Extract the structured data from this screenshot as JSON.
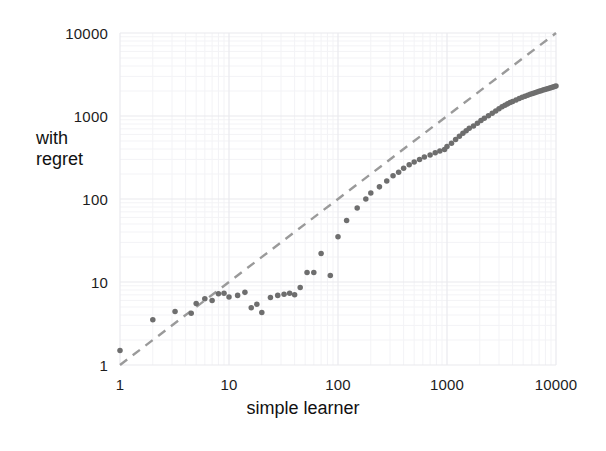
{
  "chart_data": {
    "type": "scatter",
    "title": "",
    "subtitle": "",
    "xlabel": "simple learner",
    "ylabel": "with regret",
    "xscale": "log",
    "yscale": "log",
    "xlim": [
      1,
      10000
    ],
    "ylim": [
      1,
      10000
    ],
    "xticks": [
      1,
      10,
      100,
      1000,
      10000
    ],
    "yticks": [
      1,
      10,
      100,
      1000,
      10000
    ],
    "xtick_labels": [
      "1",
      "10",
      "100",
      "1000",
      "10000"
    ],
    "ytick_labels": [
      "1",
      "10",
      "100",
      "1000",
      "10000"
    ],
    "grid": true,
    "minor_grid": true,
    "legend": "none",
    "annotations": [],
    "series": [
      {
        "name": "data",
        "type": "scatter",
        "marker": "circle",
        "marker_size": 4,
        "color": "#6e6e6e",
        "points": [
          [
            1,
            1.5
          ],
          [
            2,
            3.5
          ],
          [
            3.2,
            4.4
          ],
          [
            4.5,
            4.2
          ],
          [
            5,
            5.5
          ],
          [
            6,
            6.3
          ],
          [
            7,
            6.0
          ],
          [
            8,
            7.2
          ],
          [
            9,
            7.3
          ],
          [
            10,
            6.6
          ],
          [
            12,
            6.9
          ],
          [
            14,
            7.5
          ],
          [
            16,
            4.9
          ],
          [
            18,
            5.4
          ],
          [
            20,
            4.3
          ],
          [
            24,
            6.5
          ],
          [
            28,
            6.9
          ],
          [
            32,
            7.1
          ],
          [
            36,
            7.3
          ],
          [
            40,
            7.0
          ],
          [
            45,
            8.6
          ],
          [
            52,
            13
          ],
          [
            60,
            13
          ],
          [
            70,
            22
          ],
          [
            85,
            12
          ],
          [
            100,
            35
          ],
          [
            120,
            55
          ],
          [
            150,
            78
          ],
          [
            180,
            100
          ],
          [
            200,
            118
          ],
          [
            240,
            140
          ],
          [
            280,
            165
          ],
          [
            320,
            190
          ],
          [
            360,
            210
          ],
          [
            400,
            235
          ],
          [
            450,
            258
          ],
          [
            500,
            280
          ],
          [
            560,
            300
          ],
          [
            620,
            320
          ],
          [
            700,
            340
          ],
          [
            780,
            360
          ],
          [
            860,
            378
          ],
          [
            950,
            395
          ],
          [
            1000,
            430
          ],
          [
            1100,
            470
          ],
          [
            1200,
            520
          ],
          [
            1300,
            570
          ],
          [
            1400,
            620
          ],
          [
            1500,
            665
          ],
          [
            1600,
            710
          ],
          [
            1750,
            760
          ],
          [
            1900,
            820
          ],
          [
            2050,
            880
          ],
          [
            2200,
            940
          ],
          [
            2400,
            1010
          ],
          [
            2600,
            1080
          ],
          [
            2800,
            1150
          ],
          [
            3000,
            1220
          ],
          [
            3200,
            1290
          ],
          [
            3400,
            1350
          ],
          [
            3600,
            1400
          ],
          [
            3800,
            1450
          ],
          [
            4000,
            1500
          ],
          [
            4300,
            1560
          ],
          [
            4600,
            1620
          ],
          [
            4900,
            1680
          ],
          [
            5200,
            1730
          ],
          [
            5500,
            1780
          ],
          [
            5800,
            1830
          ],
          [
            6100,
            1870
          ],
          [
            6400,
            1910
          ],
          [
            6700,
            1950
          ],
          [
            7000,
            1985
          ],
          [
            7300,
            2020
          ],
          [
            7600,
            2055
          ],
          [
            7900,
            2090
          ],
          [
            8200,
            2120
          ],
          [
            8500,
            2150
          ],
          [
            8800,
            2180
          ],
          [
            9100,
            2210
          ],
          [
            9400,
            2240
          ],
          [
            9700,
            2270
          ],
          [
            10000,
            2300
          ]
        ]
      }
    ],
    "reference_line": {
      "name": "y = x diagonal",
      "style": "dashed",
      "color": "#9a9a9a",
      "from": [
        1,
        1
      ],
      "to": [
        10000,
        10000
      ]
    }
  },
  "axes": {
    "y_title": "with\nregret",
    "x_title": "simple learner"
  },
  "colors": {
    "marker": "#6e6e6e",
    "reference": "#9a9a9a",
    "grid_major": "#e9e9ee",
    "grid_minor": "#f3f3f6",
    "text": "#1d1d1d",
    "background": "#ffffff"
  }
}
